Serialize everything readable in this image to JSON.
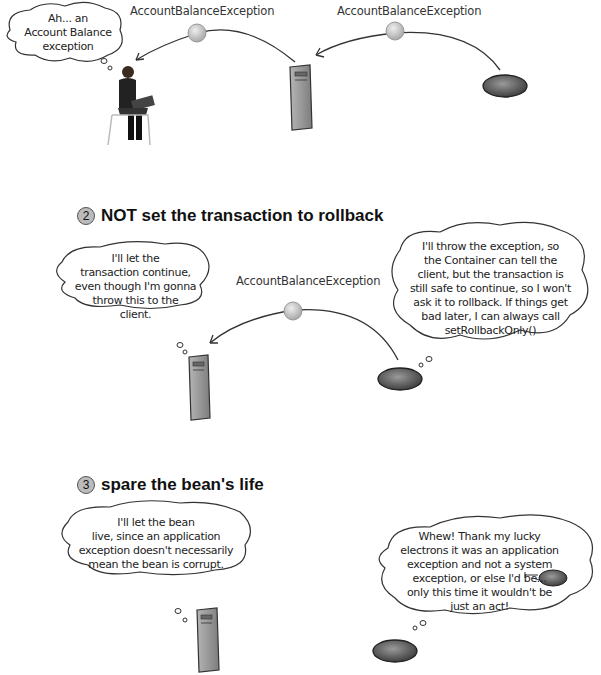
{
  "section1": {
    "exception_label_left": "AccountBalanceException",
    "exception_label_right": "AccountBalanceException",
    "client_thought": "Ah... an\nAccount Balance\nexception"
  },
  "section2": {
    "number": "2",
    "heading": "NOT set the transaction to rollback",
    "container_thought": "I'll let the\ntransaction continue,\neven though I'm gonna\nthrow this to the\nclient.",
    "exception_label": "AccountBalanceException",
    "bean_thought": "I'll throw the exception, so\nthe Container can tell the\nclient, but the transaction is\nstill safe to continue, so I won't\nask it to rollback. If things get\nbad later, I can always call\nsetRollbackOnly()"
  },
  "section3": {
    "number": "3",
    "heading": "spare the bean's life",
    "container_thought": "I'll let the bean\nlive, since an application\nexception doesn't necessarily\nmean the bean is corrupt.",
    "bean_thought": "Whew! Thank my lucky\nelectrons it was an application\nexception and not a system\nexception, or else I'd be...\nonly this time it wouldn't be\njust an act!"
  },
  "colors": {
    "server_fill": "#9a9a9a",
    "bean_fill": "#6e6e6e",
    "exception_ball": "#cfcfcf",
    "line": "#333333"
  }
}
